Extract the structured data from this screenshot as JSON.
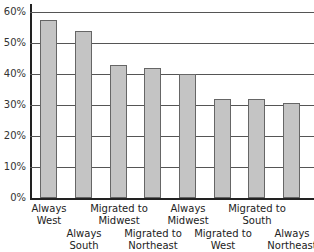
{
  "chart_data": {
    "type": "bar",
    "title": "",
    "xlabel": "",
    "ylabel": "",
    "ylim": [
      0,
      60
    ],
    "yticks": [
      "0%",
      "10%",
      "20%",
      "30%",
      "40%",
      "50%",
      "60%"
    ],
    "grid": true,
    "categories": [
      "Always West",
      "Always South",
      "Migrated to Midwest",
      "Migrated to Northeast",
      "Always Midwest",
      "Migrated to West",
      "Migrated to South",
      "Always Northeast"
    ],
    "values": [
      57.5,
      54,
      43,
      42,
      40,
      32,
      32,
      30.5
    ],
    "bar_color": "#c4c4c4"
  },
  "labels": [
    {
      "line1": "Always",
      "line2": "West"
    },
    {
      "line1": "Always",
      "line2": "South"
    },
    {
      "line1": "Migrated to",
      "line2": "Midwest"
    },
    {
      "line1": "Migrated to",
      "line2": "Northeast"
    },
    {
      "line1": "Always",
      "line2": "Midwest"
    },
    {
      "line1": "Migrated to",
      "line2": "West"
    },
    {
      "line1": "Migrated to",
      "line2": "South"
    },
    {
      "line1": "Always",
      "line2": "Northeast"
    }
  ]
}
